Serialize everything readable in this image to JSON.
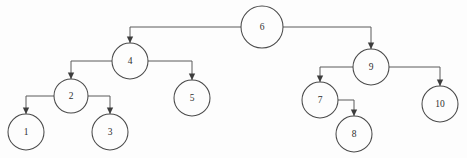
{
  "diagram": {
    "type": "tree",
    "background_color": "#fdfdfd",
    "node_stroke_color": "#4a4a4a",
    "edge_color": "#5a5a5a",
    "label_color": "#2f2f2f",
    "nodes": [
      {
        "id": "n6",
        "label": "6",
        "cx": 262,
        "cy": 27,
        "r": 21
      },
      {
        "id": "n4",
        "label": "4",
        "cx": 130,
        "cy": 61,
        "r": 18
      },
      {
        "id": "n9",
        "label": "9",
        "cx": 371,
        "cy": 67,
        "r": 18
      },
      {
        "id": "n2",
        "label": "2",
        "cx": 71,
        "cy": 96,
        "r": 17
      },
      {
        "id": "n5",
        "label": "5",
        "cx": 192,
        "cy": 98,
        "r": 18
      },
      {
        "id": "n7",
        "label": "7",
        "cx": 320,
        "cy": 100,
        "r": 18
      },
      {
        "id": "n10",
        "label": "10",
        "cx": 440,
        "cy": 104,
        "r": 18
      },
      {
        "id": "n1",
        "label": "1",
        "cx": 26,
        "cy": 132,
        "r": 18
      },
      {
        "id": "n3",
        "label": "3",
        "cx": 110,
        "cy": 132,
        "r": 18
      },
      {
        "id": "n8",
        "label": "8",
        "cx": 354,
        "cy": 134,
        "r": 18
      }
    ],
    "edges": [
      {
        "id": "e6-4",
        "from": "6",
        "to": "4",
        "points": "241,27 130,27 130,43",
        "arrow_x": 130,
        "arrow_y": 43
      },
      {
        "id": "e6-9",
        "from": "6",
        "to": "9",
        "points": "283,27 371,27 371,49",
        "arrow_x": 371,
        "arrow_y": 49
      },
      {
        "id": "e4-2",
        "from": "4",
        "to": "2",
        "points": "112,61 71,61 71,79",
        "arrow_x": 71,
        "arrow_y": 79
      },
      {
        "id": "e4-5",
        "from": "4",
        "to": "5",
        "points": "148,61 192,61 192,80",
        "arrow_x": 192,
        "arrow_y": 80
      },
      {
        "id": "e2-1",
        "from": "2",
        "to": "1",
        "points": "54,96 26,96 26,114",
        "arrow_x": 26,
        "arrow_y": 114
      },
      {
        "id": "e2-3",
        "from": "2",
        "to": "3",
        "points": "88,96 110,96 110,114",
        "arrow_x": 110,
        "arrow_y": 114
      },
      {
        "id": "e9-7",
        "from": "9",
        "to": "7",
        "points": "353,67 320,67 320,82",
        "arrow_x": 320,
        "arrow_y": 82
      },
      {
        "id": "e9-10",
        "from": "9",
        "to": "10",
        "points": "389,67 440,67 440,86",
        "arrow_x": 440,
        "arrow_y": 86
      },
      {
        "id": "e7-8",
        "from": "7",
        "to": "8",
        "points": "338,100 354,100 354,116",
        "arrow_x": 354,
        "arrow_y": 116
      }
    ]
  }
}
